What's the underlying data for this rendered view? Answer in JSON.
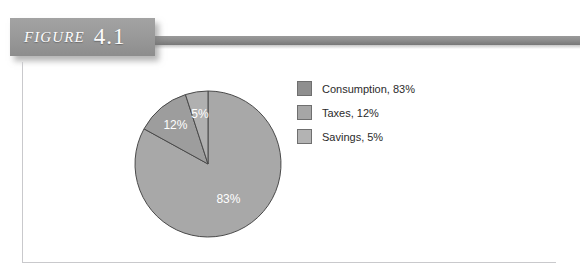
{
  "figure": {
    "word": "FIGURE",
    "number": "4.1"
  },
  "colors": {
    "consumption": "#a8a8a8",
    "taxes": "#9d9d9d",
    "savings": "#b0b0b0",
    "slice_outline": "#4a4a4a",
    "banner": "#8e8e8e",
    "frame_border": "#c9c9cc",
    "label_text": "#ffffff"
  },
  "legend": {
    "items": [
      {
        "label": "Consumption, 83%",
        "swatch": "#8f8f8f",
        "name": "legend-item-consumption"
      },
      {
        "label": "Taxes, 12%",
        "swatch": "#a6a6a6",
        "name": "legend-item-taxes"
      },
      {
        "label": "Savings, 5%",
        "swatch": "#b3b3b3",
        "name": "legend-item-savings"
      }
    ]
  },
  "chart_data": {
    "type": "pie",
    "title": "",
    "labels": [
      "Consumption",
      "Taxes",
      "Savings"
    ],
    "values": [
      83,
      12,
      5
    ],
    "value_labels": [
      "83%",
      "12%",
      "5%"
    ],
    "unit": "%",
    "start_angle_deg": 0,
    "direction": "clockwise",
    "legend_position": "right",
    "legend_entries": [
      "Consumption, 83%",
      "Taxes, 12%",
      "Savings, 5%"
    ],
    "slice_colors": [
      "#a8a8a8",
      "#9d9d9d",
      "#b0b0b0"
    ],
    "radius_px": 73,
    "center_px": [
      80,
      80
    ]
  }
}
